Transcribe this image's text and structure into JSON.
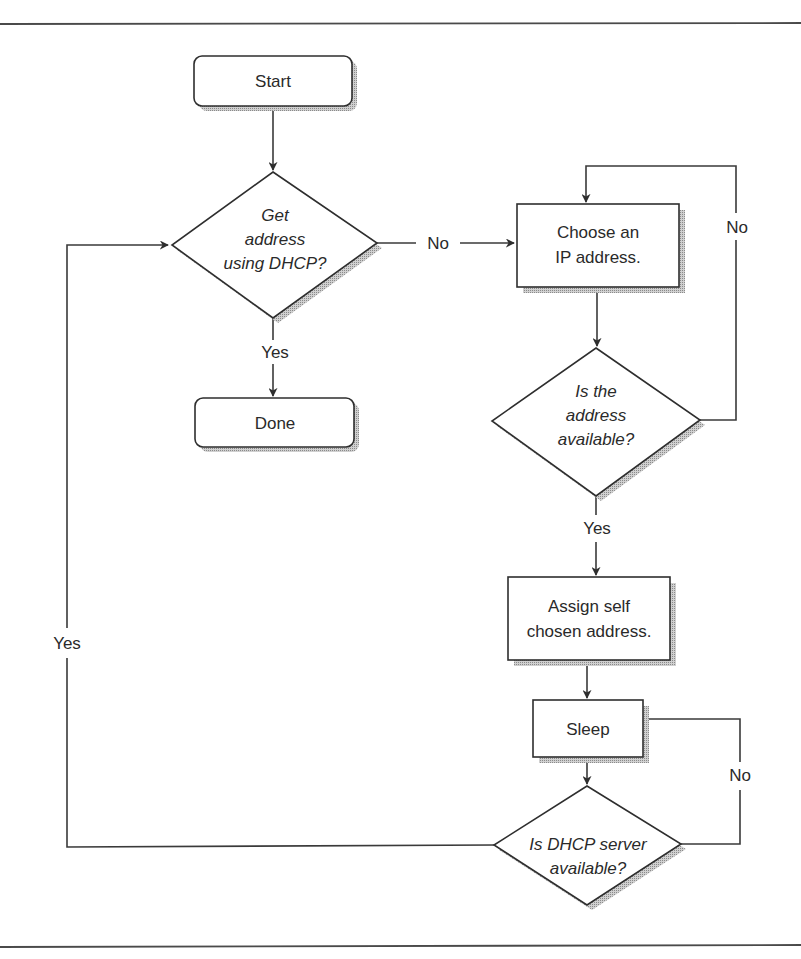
{
  "diagram": {
    "type": "flowchart",
    "nodes": {
      "start": {
        "shape": "rounded-rect",
        "label": "Start"
      },
      "get_dhcp": {
        "shape": "diamond",
        "lines": [
          "Get",
          "address",
          "using DHCP?"
        ]
      },
      "done": {
        "shape": "rounded-rect",
        "label": "Done"
      },
      "choose_ip": {
        "shape": "rect",
        "lines": [
          "Choose an",
          "IP address."
        ]
      },
      "is_available": {
        "shape": "diamond",
        "lines": [
          "Is the",
          "address",
          "available?"
        ]
      },
      "assign_self": {
        "shape": "rect",
        "lines": [
          "Assign self",
          "chosen address."
        ]
      },
      "sleep": {
        "shape": "rect",
        "label": "Sleep"
      },
      "dhcp_server": {
        "shape": "diamond",
        "lines": [
          "Is DHCP server",
          "available?"
        ]
      }
    },
    "edge_labels": {
      "get_dhcp_no": "No",
      "get_dhcp_yes": "Yes",
      "is_available_no": "No",
      "is_available_yes": "Yes",
      "dhcp_server_no": "No",
      "dhcp_server_yes": "Yes"
    },
    "edges": [
      {
        "from": "start",
        "to": "get_dhcp",
        "label": ""
      },
      {
        "from": "get_dhcp",
        "to": "choose_ip",
        "label": "No"
      },
      {
        "from": "get_dhcp",
        "to": "done",
        "label": "Yes"
      },
      {
        "from": "choose_ip",
        "to": "is_available",
        "label": ""
      },
      {
        "from": "is_available",
        "to": "choose_ip",
        "label": "No"
      },
      {
        "from": "is_available",
        "to": "assign_self",
        "label": "Yes"
      },
      {
        "from": "assign_self",
        "to": "sleep",
        "label": ""
      },
      {
        "from": "sleep",
        "to": "dhcp_server",
        "label": ""
      },
      {
        "from": "dhcp_server",
        "to": "sleep",
        "label": "No"
      },
      {
        "from": "dhcp_server",
        "to": "get_dhcp",
        "label": "Yes"
      }
    ]
  }
}
